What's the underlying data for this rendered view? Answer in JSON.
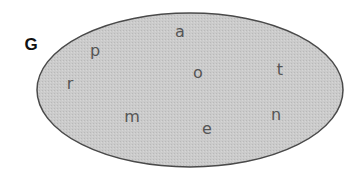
{
  "diagram": {
    "type": "set-diagram",
    "set": {
      "label": "G",
      "label_pos": {
        "x": 31,
        "y": 44
      },
      "shape": {
        "cx": 190,
        "cy": 90,
        "rx": 153,
        "ry": 77
      },
      "fill": "#c9c9c9",
      "stroke": "#4a4a4a"
    },
    "elements": [
      {
        "text": "p",
        "x": 95,
        "y": 51
      },
      {
        "text": "a",
        "x": 180,
        "y": 32
      },
      {
        "text": "r",
        "x": 70,
        "y": 84
      },
      {
        "text": "o",
        "x": 198,
        "y": 73
      },
      {
        "text": "t",
        "x": 280,
        "y": 70
      },
      {
        "text": "m",
        "x": 132,
        "y": 117
      },
      {
        "text": "e",
        "x": 207,
        "y": 129
      },
      {
        "text": "n",
        "x": 276,
        "y": 115
      }
    ]
  }
}
